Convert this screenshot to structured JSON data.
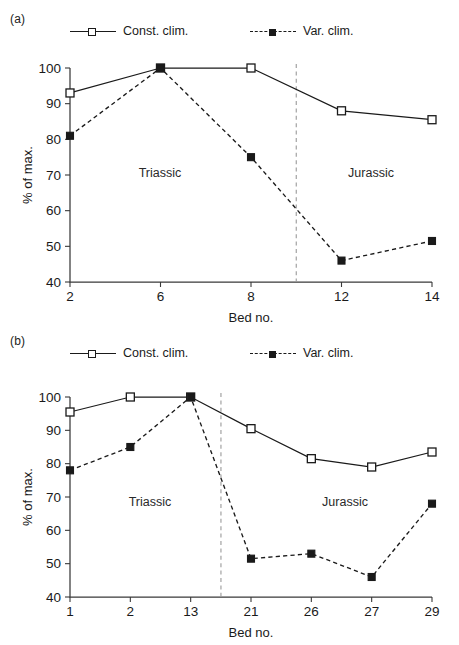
{
  "figure": {
    "panel_a_tag": "(a)",
    "panel_b_tag": "(b)"
  },
  "legend": {
    "const_label": "Const. clim.",
    "var_label": "Var. clim.",
    "const_marker": "open-square-solid-line",
    "var_marker": "filled-square-dashed-line"
  },
  "axes": {
    "ylabel": "% of max.",
    "xlabel": "Bed no.",
    "yticks": [
      40,
      50,
      60,
      70,
      80,
      90,
      100
    ],
    "ylim": [
      40,
      100
    ]
  },
  "eras": {
    "triassic": "Triassic",
    "jurassic": "Jurassic"
  },
  "colors": {
    "line": "#1a1a1a",
    "axis": "#3a3a3a",
    "divider": "#9a9a9a",
    "background": "#ffffff"
  },
  "chart_data": [
    {
      "panel": "(a)",
      "type": "line",
      "title": "",
      "xlabel": "Bed no.",
      "ylabel": "% of max.",
      "ylim": [
        40,
        100
      ],
      "yticks": [
        40,
        50,
        60,
        70,
        80,
        90,
        100
      ],
      "categories": [
        "2",
        "6",
        "8",
        "12",
        "14"
      ],
      "grid": false,
      "legend_position": "above-plot",
      "annotations": [
        {
          "text": "Triassic",
          "x_category_span": [
            "2",
            "8"
          ]
        },
        {
          "text": "Jurassic",
          "x_category_span": [
            "12",
            "14"
          ]
        },
        {
          "text": "era-boundary-dashed-vertical",
          "between": [
            "8",
            "12"
          ]
        }
      ],
      "series": [
        {
          "name": "Const. clim.",
          "marker": "open-square",
          "line": "solid",
          "values": [
            93,
            100,
            100,
            88,
            85.5
          ]
        },
        {
          "name": "Var. clim.",
          "marker": "filled-square",
          "line": "dashed",
          "values": [
            81,
            100,
            75,
            46,
            51.5
          ]
        }
      ]
    },
    {
      "panel": "(b)",
      "type": "line",
      "title": "",
      "xlabel": "Bed no.",
      "ylabel": "% of max.",
      "ylim": [
        40,
        100
      ],
      "yticks": [
        40,
        50,
        60,
        70,
        80,
        90,
        100
      ],
      "categories": [
        "1",
        "2",
        "13",
        "21",
        "26",
        "27",
        "29"
      ],
      "grid": false,
      "legend_position": "above-plot",
      "annotations": [
        {
          "text": "Triassic",
          "x_category_span": [
            "1",
            "13"
          ]
        },
        {
          "text": "Jurassic",
          "x_category_span": [
            "21",
            "29"
          ]
        },
        {
          "text": "era-boundary-dashed-vertical",
          "between": [
            "13",
            "21"
          ]
        }
      ],
      "series": [
        {
          "name": "Const. clim.",
          "marker": "open-square",
          "line": "solid",
          "values": [
            95.5,
            100,
            100,
            90.5,
            81.5,
            79,
            83.5
          ]
        },
        {
          "name": "Var. clim.",
          "marker": "filled-square",
          "line": "dashed",
          "values": [
            78,
            85,
            100,
            51.5,
            53,
            46,
            68
          ]
        }
      ]
    }
  ]
}
